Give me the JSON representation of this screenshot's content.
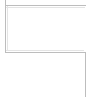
{
  "canvas": {
    "width": 90,
    "height": 97,
    "background_color": "#ffffff",
    "description": "Stepped L-shaped frame corner fragment"
  },
  "colors": {
    "rule": "#bdbdbd",
    "rule_soft": "#e4e4e4",
    "background": "#ffffff"
  },
  "frame": {
    "upper_panel": {
      "label": "upper-panel-region",
      "x": 5,
      "y": 5,
      "width": 81,
      "height": 47
    },
    "rules": [
      {
        "name": "top-horizontal-rule",
        "orientation": "horizontal",
        "x": 5,
        "y": 5,
        "length": 81,
        "thickness": 1,
        "color": "#bdbdbd"
      },
      {
        "name": "left-vertical-rule",
        "orientation": "vertical",
        "x": 5,
        "y": 0,
        "length": 53,
        "thickness": 1,
        "color": "#bdbdbd"
      },
      {
        "name": "middle-horizontal-rule",
        "orientation": "horizontal",
        "x": 5,
        "y": 52,
        "length": 81,
        "thickness": 1,
        "color": "#bdbdbd"
      },
      {
        "name": "right-vertical-rule",
        "orientation": "vertical",
        "x": 85,
        "y": 52,
        "length": 45,
        "thickness": 1,
        "color": "#bdbdbd"
      }
    ],
    "soft_rules": [
      {
        "name": "top-inner-highlight",
        "orientation": "horizontal",
        "x": 6,
        "y": 7,
        "length": 79,
        "thickness": 1,
        "color": "#e4e4e4"
      },
      {
        "name": "middle-inner-highlight",
        "orientation": "horizontal",
        "x": 6,
        "y": 50,
        "length": 78,
        "thickness": 1,
        "color": "#e4e4e4"
      },
      {
        "name": "left-inner-highlight",
        "orientation": "vertical",
        "x": 7,
        "y": 6,
        "length": 45,
        "thickness": 1,
        "color": "#e4e4e4"
      }
    ],
    "corners": [
      {
        "name": "top-left-corner",
        "x": 5,
        "y": 5,
        "type": "outer"
      },
      {
        "name": "top-right-terminus",
        "x": 86,
        "y": 5,
        "type": "open-end"
      },
      {
        "name": "bottom-left-terminus",
        "x": 5,
        "y": 52,
        "type": "open-end"
      },
      {
        "name": "step-inner-corner",
        "x": 85,
        "y": 52,
        "type": "inner"
      },
      {
        "name": "bottom-right-terminus",
        "x": 85,
        "y": 97,
        "type": "open-end"
      }
    ]
  },
  "accessibility": {
    "alt_text": "Stepped frame corner: rectangular outline at top-left with a vertical rule descending from its lower-right toward the bottom edge"
  }
}
